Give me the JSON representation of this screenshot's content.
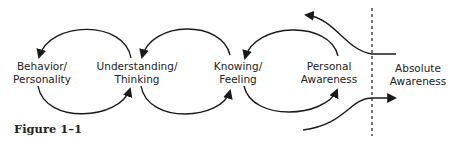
{
  "diagram": {
    "nodes": [
      {
        "id": "behavior",
        "line1": "Behavior/",
        "line2": "Personality"
      },
      {
        "id": "understanding",
        "line1": "Understanding/",
        "line2": "Thinking"
      },
      {
        "id": "knowing",
        "line1": "Knowing/",
        "line2": "Feeling"
      },
      {
        "id": "personal",
        "line1": "Personal",
        "line2": "Awareness"
      },
      {
        "id": "absolute",
        "line1": "Absolute",
        "line2": "Awareness"
      }
    ],
    "caption": "Figure 1–1",
    "colors": {
      "stroke": "#1a1a1a",
      "text": "#222222",
      "background": "#ffffff"
    }
  }
}
